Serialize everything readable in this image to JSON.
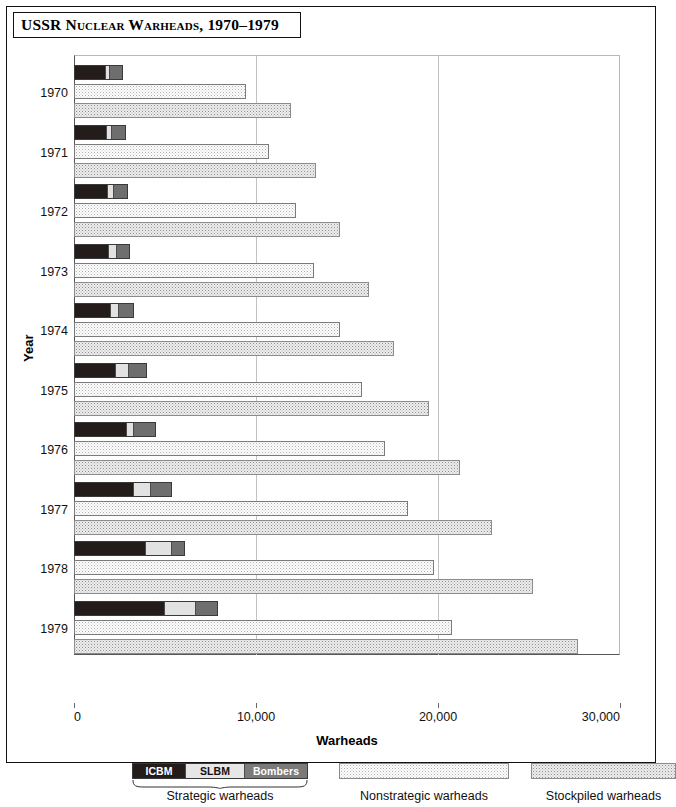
{
  "title": "USSR Nuclear Warheads, 1970–1979",
  "axes": {
    "ylabel": "Year",
    "xlabel": "Warheads",
    "xticks": [
      "0",
      "10,000",
      "20,000",
      "30,000"
    ]
  },
  "legend": {
    "strategic": {
      "caption": "Strategic warheads",
      "segments": [
        "ICBM",
        "SLBM",
        "Bombers"
      ]
    },
    "nonstrategic": {
      "caption": "Nonstrategic warheads"
    },
    "stockpiled": {
      "caption": "Stockpiled warheads"
    }
  },
  "colors": {
    "icbm": "#231c1a",
    "slbm": "#e2e2e2",
    "bombers": "#6e6e6e",
    "nonstrategic": "#fdfdfd",
    "stockpiled": "#eeeeee",
    "gridline": "#c2c2c2",
    "frame": "#111111"
  },
  "chart_data": {
    "type": "bar",
    "orientation": "horizontal",
    "title": "USSR Nuclear Warheads, 1970–1979",
    "xlabel": "Warheads",
    "ylabel": "Year",
    "xlim": [
      0,
      30000
    ],
    "xticks": [
      0,
      10000,
      20000,
      30000
    ],
    "grid": true,
    "legend_position": "bottom",
    "categories": [
      "1970",
      "1971",
      "1972",
      "1973",
      "1974",
      "1975",
      "1976",
      "1977",
      "1978",
      "1979"
    ],
    "series": [
      {
        "name": "ICBM",
        "stack": "strategic",
        "values": [
          1700,
          1800,
          1850,
          1900,
          2000,
          2250,
          2900,
          3250,
          3900,
          4950
        ]
      },
      {
        "name": "SLBM",
        "stack": "strategic",
        "values": [
          300,
          300,
          350,
          500,
          500,
          800,
          0,
          1000,
          1500,
          1800
        ]
      },
      {
        "name": "Bombers",
        "stack": "strategic",
        "values": [
          700,
          750,
          750,
          700,
          800,
          950,
          1150,
          1150,
          700,
          1150
        ]
      },
      {
        "name": "Strategic warheads",
        "total": true,
        "values": [
          2700,
          2900,
          2950,
          3100,
          3300,
          4000,
          4500,
          5050,
          6100,
          5950
        ]
      },
      {
        "name": "Nonstrategic warheads",
        "values": [
          9450,
          10700,
          12200,
          13200,
          14600,
          15800,
          17100,
          18350,
          19800,
          20750
        ]
      },
      {
        "name": "Stockpiled warheads",
        "values": [
          11900,
          13300,
          14600,
          16200,
          17600,
          19500,
          21200,
          22950,
          25200,
          27700
        ]
      }
    ]
  },
  "rows": [
    {
      "year": "1970",
      "icbm": 1700,
      "slbm": 300,
      "bombers": 700,
      "nonstrategic": 9450,
      "stockpiled": 11900
    },
    {
      "year": "1971",
      "icbm": 1800,
      "slbm": 300,
      "bombers": 750,
      "nonstrategic": 10700,
      "stockpiled": 13300
    },
    {
      "year": "1972",
      "icbm": 1850,
      "slbm": 350,
      "bombers": 750,
      "nonstrategic": 12200,
      "stockpiled": 14600
    },
    {
      "year": "1973",
      "icbm": 1900,
      "slbm": 500,
      "bombers": 700,
      "nonstrategic": 13200,
      "stockpiled": 16200
    },
    {
      "year": "1974",
      "icbm": 2000,
      "slbm": 500,
      "bombers": 800,
      "nonstrategic": 14600,
      "stockpiled": 17600
    },
    {
      "year": "1975",
      "icbm": 2250,
      "slbm": 800,
      "bombers": 950,
      "nonstrategic": 15800,
      "stockpiled": 19500
    },
    {
      "year": "1976",
      "icbm": 2900,
      "slbm": 450,
      "bombers": 1150,
      "nonstrategic": 17100,
      "stockpiled": 21200
    },
    {
      "year": "1977",
      "icbm": 3250,
      "slbm": 1000,
      "bombers": 1150,
      "nonstrategic": 18350,
      "stockpiled": 22950
    },
    {
      "year": "1978",
      "icbm": 3900,
      "slbm": 1500,
      "bombers": 700,
      "nonstrategic": 19800,
      "stockpiled": 25200
    },
    {
      "year": "1979",
      "icbm": 4950,
      "slbm": 1800,
      "bombers": 1150,
      "nonstrategic": 20750,
      "stockpiled": 27700
    }
  ]
}
